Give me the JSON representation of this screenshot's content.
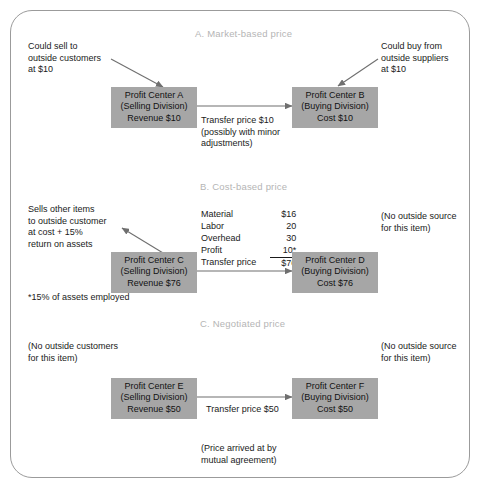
{
  "figure": {
    "title_a": "A. Market-based price",
    "title_b": "B. Cost-based price",
    "title_c": "C. Negotiated price"
  },
  "section_a": {
    "left_note": "Could sell to\noutside customers\nat $10",
    "right_note": "Could buy from\noutside suppliers\nat $10",
    "selling_box": {
      "name": "Profit Center A",
      "division": "(Selling Division)",
      "amount": "Revenue $10"
    },
    "buying_box": {
      "name": "Profit Center B",
      "division": "(Buying Division)",
      "amount": "Cost $10"
    },
    "arrow_note": "Transfer price $10\n(possibly with minor\nadjustments)"
  },
  "section_b": {
    "left_note": "Sells other items\nto outside customer\nat cost +  15%\nreturn on assets",
    "right_note": "(No outside source\nfor this item)",
    "selling_box": {
      "name": "Profit Center C",
      "division": "(Selling Division)",
      "amount": "Revenue $76"
    },
    "buying_box": {
      "name": "Profit Center D",
      "division": "(Buying Division)",
      "amount": "Cost $76"
    },
    "cost_rows": [
      {
        "label": "Material",
        "value": "$16"
      },
      {
        "label": "Labor",
        "value": "20"
      },
      {
        "label": "Overhead",
        "value": "30"
      },
      {
        "label": "Profit",
        "value": "10*"
      },
      {
        "label": "Transfer price",
        "value": "$76"
      }
    ],
    "footnote": "*15% of assets employed"
  },
  "section_c": {
    "left_note": "(No outside customers\nfor this item)",
    "right_note": "(No outside source\nfor this item)",
    "selling_box": {
      "name": "Profit Center E",
      "division": "(Selling Division)",
      "amount": "Revenue $50"
    },
    "buying_box": {
      "name": "Profit Center F",
      "division": "(Buying Division)",
      "amount": "Cost $50"
    },
    "arrow_note": "Transfer price $50",
    "bottom_note": "(Price arrived at by\nmutual agreement)"
  },
  "colors": {
    "box_fill": "#a6a6a6",
    "frame_border": "#9b9b9b",
    "section_title": "#b5b5b5",
    "line": "#6f6f6f",
    "text": "#1a1a1a"
  }
}
